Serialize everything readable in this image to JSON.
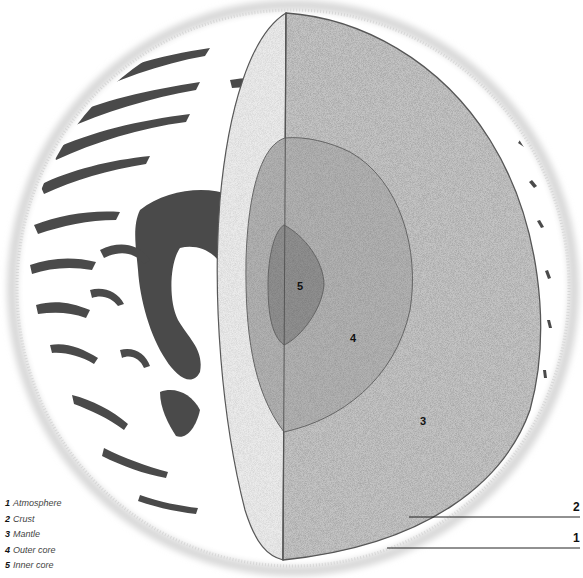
{
  "diagram": {
    "layer_labels": [
      {
        "number": "1",
        "name": "Atmosphere"
      },
      {
        "number": "2",
        "name": "Crust"
      },
      {
        "number": "3",
        "name": "Mantle"
      },
      {
        "number": "4",
        "name": "Outer core"
      },
      {
        "number": "5",
        "name": "Inner core"
      }
    ],
    "in_figure_labels": {
      "mantle": "3",
      "outer_core": "4",
      "inner_core": "5"
    },
    "callouts": {
      "crust": "2",
      "atmosphere": "1"
    },
    "colors": {
      "background": "#ffffff",
      "atmosphere_haze": "#d8d8d8",
      "surface_ink": "#4a4a4a",
      "crust_section": "#ebebeb",
      "mantle": "#c4c4c4",
      "outer_core": "#b2b2b2",
      "inner_core": "#8f8f8f",
      "outline": "#555555"
    }
  }
}
